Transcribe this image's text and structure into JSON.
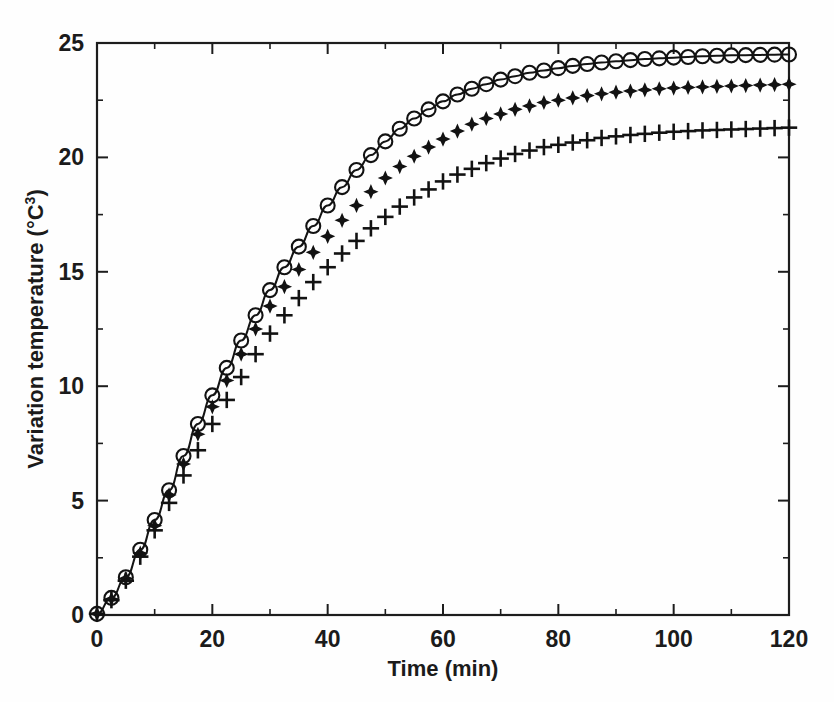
{
  "figure": {
    "background_color": "#fefefe",
    "ink_color": "#141414"
  },
  "chart_data": {
    "type": "line",
    "title": "",
    "subtitle": "",
    "xlabel": "Time (min)",
    "ylabel": "Variation temperature (°C³)",
    "ylabel_base": "Variation temperature (°C",
    "ylabel_superscript": "3",
    "ylabel_close": ")",
    "xlim": [
      0,
      120
    ],
    "ylim": [
      0,
      25
    ],
    "xticks": [
      0,
      20,
      40,
      60,
      80,
      100,
      120
    ],
    "yticks": [
      0,
      5,
      10,
      15,
      20,
      25
    ],
    "xtick_labels": [
      "0",
      "20",
      "40",
      "60",
      "80",
      "100",
      "120"
    ],
    "ytick_labels": [
      "0",
      "5",
      "10",
      "15",
      "20",
      "25"
    ],
    "x_minor_interval": 10,
    "y_minor_interval": 2.5,
    "grid": false,
    "legend": "none",
    "annotations": [],
    "x": [
      0,
      2.5,
      5,
      7.5,
      10,
      12.5,
      15,
      17.5,
      20,
      22.5,
      25,
      27.5,
      30,
      32.5,
      35,
      37.5,
      40,
      42.5,
      45,
      47.5,
      50,
      52.5,
      55,
      57.5,
      60,
      62.5,
      65,
      67.5,
      70,
      72.5,
      75,
      77.5,
      80,
      82.5,
      85,
      87.5,
      90,
      92.5,
      95,
      97.5,
      100,
      102.5,
      105,
      107.5,
      110,
      112.5,
      115,
      117.5,
      120
    ],
    "series": [
      {
        "name": "series-circles",
        "marker": "open-circle",
        "has_fit_line": true,
        "values": [
          0.05,
          0.75,
          1.65,
          2.85,
          4.15,
          5.45,
          6.95,
          8.35,
          9.6,
          10.8,
          12.0,
          13.1,
          14.2,
          15.2,
          16.1,
          17.0,
          17.9,
          18.7,
          19.45,
          20.1,
          20.7,
          21.25,
          21.7,
          22.1,
          22.45,
          22.75,
          23.0,
          23.2,
          23.4,
          23.55,
          23.7,
          23.8,
          23.9,
          24.0,
          24.08,
          24.15,
          24.2,
          24.25,
          24.3,
          24.33,
          24.36,
          24.39,
          24.42,
          24.44,
          24.46,
          24.47,
          24.48,
          24.49,
          24.5
        ]
      },
      {
        "name": "series-diamonds",
        "marker": "filled-diamond",
        "has_fit_line": false,
        "values": [
          0.05,
          0.7,
          1.6,
          2.7,
          3.9,
          5.25,
          6.6,
          7.9,
          9.1,
          10.25,
          11.4,
          12.5,
          13.5,
          14.35,
          15.1,
          15.85,
          16.55,
          17.25,
          17.9,
          18.5,
          19.1,
          19.6,
          20.05,
          20.45,
          20.8,
          21.15,
          21.45,
          21.7,
          21.9,
          22.1,
          22.25,
          22.4,
          22.5,
          22.6,
          22.7,
          22.78,
          22.85,
          22.9,
          22.95,
          23.0,
          23.03,
          23.06,
          23.08,
          23.1,
          23.12,
          23.14,
          23.16,
          23.18,
          23.2
        ]
      },
      {
        "name": "series-plus",
        "marker": "plus",
        "has_fit_line": false,
        "values": [
          0.05,
          0.65,
          1.5,
          2.55,
          3.7,
          4.9,
          6.1,
          7.2,
          8.35,
          9.4,
          10.4,
          11.4,
          12.3,
          13.1,
          13.85,
          14.55,
          15.2,
          15.8,
          16.35,
          16.9,
          17.4,
          17.85,
          18.25,
          18.6,
          18.95,
          19.25,
          19.5,
          19.75,
          19.95,
          20.15,
          20.3,
          20.45,
          20.55,
          20.65,
          20.75,
          20.85,
          20.92,
          20.98,
          21.03,
          21.08,
          21.12,
          21.15,
          21.18,
          21.2,
          21.22,
          21.24,
          21.26,
          21.28,
          21.3
        ]
      }
    ]
  }
}
